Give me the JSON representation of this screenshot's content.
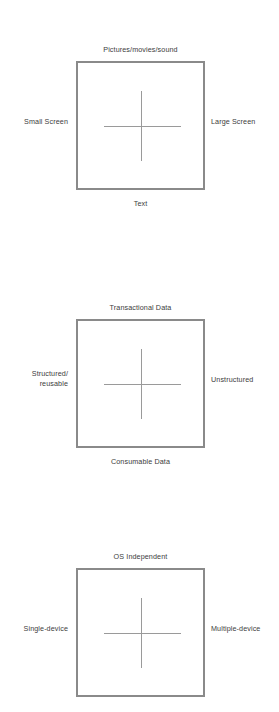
{
  "page": {
    "background_color": "#ffffff",
    "text_color": "#3c3c3c",
    "box_border_color": "#8a8a8a",
    "crosshair_color": "#9a9a9a"
  },
  "figures": [
    {
      "id": "media-screen-matrix",
      "top": "Pictures/movies/sound",
      "bottom": "Text",
      "left": "Small Screen",
      "right": "Large Screen"
    },
    {
      "id": "data-structure-matrix",
      "top": "Transactional Data",
      "bottom": "Consumable Data",
      "left": "Structured/\nreusable",
      "left_line1": "Structured/",
      "left_line2": "reusable",
      "right": "Unstructured"
    },
    {
      "id": "device-independence-matrix",
      "top": "OS Independent",
      "bottom": "",
      "left": "Single-device",
      "right": "Multiple-device"
    }
  ]
}
